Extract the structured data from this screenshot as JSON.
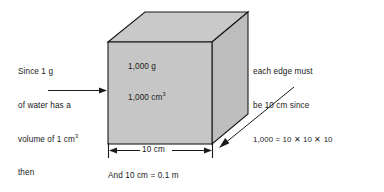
{
  "figure": {
    "type": "cube-volume-mass-diagram",
    "background_color": "#ffffff",
    "cube": {
      "face_fill": "#c6c6c6",
      "top_fill": "#c9c9c9",
      "side_fill": "#bdbdbd",
      "edge_color": "#1a1a1a",
      "mass_label": "1,000 g",
      "volume_label_prefix": "1,000 cm",
      "volume_label_exponent": "3"
    },
    "left_note": {
      "line1": "Since 1 g",
      "line2": "of water has a",
      "line3_prefix": "volume of 1 cm",
      "line3_exponent": "3",
      "line4": "then",
      "arrow": "right-arrow-to-cube"
    },
    "right_note": {
      "line1": "each edge must",
      "line2": "be 10 cm since",
      "line3": "1,000 = 10 ✕ 10 ✕ 10",
      "arrow": "diagonal-arrow-to-cube-base"
    },
    "dimension": {
      "label": "10 cm",
      "style": "double-headed-arrow-with-end-ticks"
    },
    "caption": "And 10 cm = 0.1 m"
  }
}
